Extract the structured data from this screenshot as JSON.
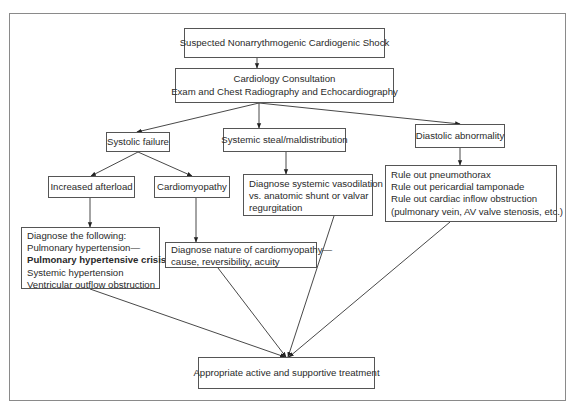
{
  "diagram": {
    "title": "Suspected Nonarrythmogenic Cardiogenic Shock",
    "nodes": {
      "start": {
        "lines": [
          "Suspected Nonarrythmogenic Cardiogenic Shock"
        ]
      },
      "consult": {
        "lines": [
          "Cardiology Consultation",
          "Exam and Chest Radiography and Echocardiography"
        ]
      },
      "systolic": {
        "lines": [
          "Systolic failure"
        ]
      },
      "steal": {
        "lines": [
          "Systemic steal/maldistribution"
        ]
      },
      "diastolic": {
        "lines": [
          "Diastolic abnormality"
        ]
      },
      "afterload": {
        "lines": [
          "Increased afterload"
        ]
      },
      "cardiomyopathy": {
        "lines": [
          "Cardiomyopathy"
        ]
      },
      "vasodilation": {
        "lines": [
          "Diagnose systemic vasodilation",
          "vs. anatomic shunt or valvar",
          "regurgitation"
        ]
      },
      "ruleout": {
        "lines": [
          "Rule out pneumothorax",
          "Rule out pericardial tamponade",
          "Rule out cardiac inflow obstruction",
          "(pulmonary vein, AV valve stenosis, etc.)"
        ]
      },
      "diagnose_following": {
        "lines": [
          "Diagnose the following:",
          "Pulmonary hypertension—",
          "Pulmonary hypertensive crisis",
          "Systemic hypertension",
          "Ventricular outflow obstruction"
        ],
        "bold_line_index": 2
      },
      "nature": {
        "lines": [
          "Diagnose nature of cardiomyopathy—",
          "cause, reversibility, acuity"
        ]
      },
      "treatment": {
        "lines": [
          "Appropriate active and supportive treatment"
        ]
      }
    },
    "edges": [
      [
        "start",
        "consult"
      ],
      [
        "consult",
        "systolic"
      ],
      [
        "consult",
        "steal"
      ],
      [
        "consult",
        "diastolic"
      ],
      [
        "systolic",
        "afterload"
      ],
      [
        "systolic",
        "cardiomyopathy"
      ],
      [
        "steal",
        "vasodilation"
      ],
      [
        "diastolic",
        "ruleout"
      ],
      [
        "afterload",
        "diagnose_following"
      ],
      [
        "cardiomyopathy",
        "nature"
      ],
      [
        "diagnose_following",
        "treatment"
      ],
      [
        "nature",
        "treatment"
      ],
      [
        "vasodilation",
        "treatment"
      ],
      [
        "ruleout",
        "treatment"
      ]
    ],
    "colors": {
      "line": "#333333",
      "border": "#555555",
      "frame": "#8a8a8a",
      "text": "#2a2a2a"
    }
  }
}
